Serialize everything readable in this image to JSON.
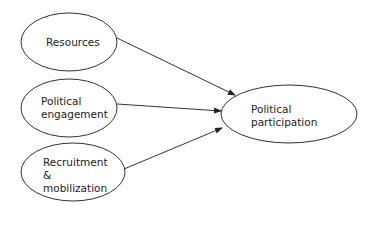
{
  "diagram": {
    "nodes": {
      "resources": {
        "label": "Resources"
      },
      "engagement": {
        "line1": "Political",
        "line2": "engagement"
      },
      "recruitment": {
        "line1": "Recruitment",
        "line2": "&",
        "line3": "mobilization"
      },
      "participation": {
        "line1": "Political",
        "line2": "participation"
      }
    },
    "edges": [
      {
        "from": "Resources",
        "to": "Political participation"
      },
      {
        "from": "Political engagement",
        "to": "Political participation"
      },
      {
        "from": "Recruitment & mobilization",
        "to": "Political participation"
      }
    ]
  }
}
